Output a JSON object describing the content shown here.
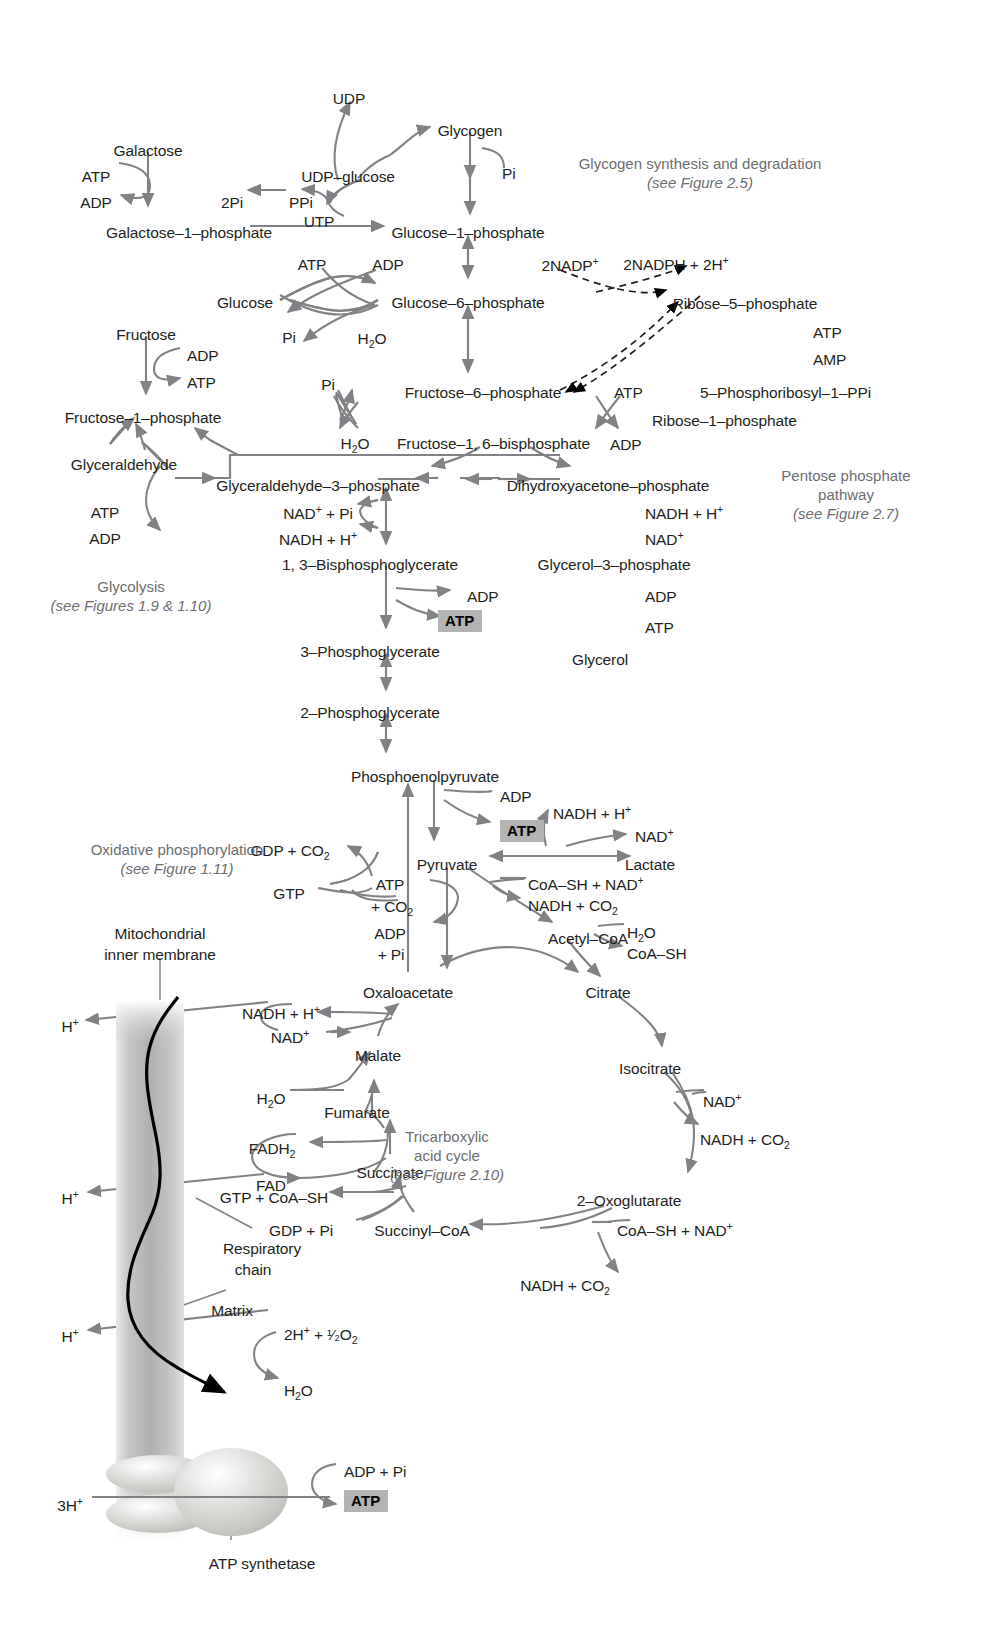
{
  "figure": {
    "type": "metabolic-pathway-diagram"
  },
  "annotations": [
    {
      "id": "glycogen-note",
      "line1": "Glycogen synthesis and degradation",
      "line2": "(see Figure 2.5)",
      "x": 700,
      "y": 155
    },
    {
      "id": "pentose-note",
      "line1": "Pentose phosphate",
      "line2": "pathway",
      "line3": "(see Figure 2.7)",
      "x": 846,
      "y": 467
    },
    {
      "id": "glycolysis-note",
      "line1": "Glycolysis",
      "line2": "(see Figures 1.9 & 1.10)",
      "x": 131,
      "y": 578
    },
    {
      "id": "oxphos-note",
      "line1": "Oxidative phosphorylation",
      "line2": "(see Figure 1.11)",
      "x": 177,
      "y": 841
    },
    {
      "id": "tca-note",
      "line1": "Tricarboxylic",
      "line2": "acid cycle",
      "line3": "(see Figure 2.10)",
      "x": 447,
      "y": 1128
    }
  ],
  "metabolites": [
    {
      "id": "udp",
      "text": "UDP",
      "x": 349,
      "y": 90,
      "align": "c"
    },
    {
      "id": "glycogen",
      "text": "Glycogen",
      "x": 470,
      "y": 122,
      "align": "c"
    },
    {
      "id": "galactose",
      "text": "Galactose",
      "x": 148,
      "y": 142,
      "align": "c"
    },
    {
      "id": "udp-glucose",
      "text": "UDP–glucose",
      "x": 348,
      "y": 168,
      "align": "c"
    },
    {
      "id": "atp-galactose",
      "text": "ATP",
      "x": 96,
      "y": 168,
      "align": "c"
    },
    {
      "id": "pi-glycogen",
      "text": "Pi",
      "x": 502,
      "y": 165,
      "align": "l"
    },
    {
      "id": "adp-galactose",
      "text": "ADP",
      "x": 96,
      "y": 194,
      "align": "c"
    },
    {
      "id": "two-pi",
      "text": "2Pi",
      "x": 232,
      "y": 194,
      "align": "c"
    },
    {
      "id": "ppi",
      "text": "PPi",
      "x": 301,
      "y": 194,
      "align": "c"
    },
    {
      "id": "utp",
      "text": "UTP",
      "x": 319,
      "y": 213,
      "align": "c"
    },
    {
      "id": "galactose-1-phosphate",
      "text": "Galactose–1–phosphate",
      "x": 189,
      "y": 224,
      "align": "c"
    },
    {
      "id": "glucose-1-phosphate",
      "text": "Glucose–1–phosphate",
      "x": 468,
      "y": 224,
      "align": "c"
    },
    {
      "id": "atp-glucose",
      "text": "ATP",
      "x": 312,
      "y": 256,
      "align": "c"
    },
    {
      "id": "adp-glucose",
      "text": "ADP",
      "x": 388,
      "y": 256,
      "align": "c"
    },
    {
      "id": "two-nadp",
      "text": "2NADP<sup>+</sup>",
      "x": 570,
      "y": 257,
      "align": "c"
    },
    {
      "id": "two-nadph",
      "text": "2NADPH + 2H<sup>+</sup>",
      "x": 676,
      "y": 256,
      "align": "c"
    },
    {
      "id": "glucose",
      "text": "Glucose",
      "x": 245,
      "y": 294,
      "align": "c"
    },
    {
      "id": "glucose-6-phosphate",
      "text": "Glucose–6–phosphate",
      "x": 468,
      "y": 294,
      "align": "c"
    },
    {
      "id": "ribose-5-phosphate",
      "text": "Ribose–5–phosphate",
      "x": 745,
      "y": 295,
      "align": "c"
    },
    {
      "id": "fructose",
      "text": "Fructose",
      "x": 146,
      "y": 326,
      "align": "c"
    },
    {
      "id": "pi-glucose",
      "text": "Pi",
      "x": 289,
      "y": 329,
      "align": "c"
    },
    {
      "id": "h2o-glucose",
      "text": "H<sub>2</sub>O",
      "x": 372,
      "y": 330,
      "align": "c"
    },
    {
      "id": "atp-ribose",
      "text": "ATP",
      "x": 813,
      "y": 324,
      "align": "l"
    },
    {
      "id": "adp-fructose",
      "text": "ADP",
      "x": 187,
      "y": 347,
      "align": "l"
    },
    {
      "id": "amp-ribose",
      "text": "AMP",
      "x": 813,
      "y": 351,
      "align": "l"
    },
    {
      "id": "pi-f6p",
      "text": "Pi",
      "x": 328,
      "y": 376,
      "align": "c"
    },
    {
      "id": "fructose-6-phosphate",
      "text": "Fructose–6–phosphate",
      "x": 483,
      "y": 384,
      "align": "c"
    },
    {
      "id": "atp-pfk",
      "text": "ATP",
      "x": 614,
      "y": 384,
      "align": "l"
    },
    {
      "id": "atp-fructose",
      "text": "ATP",
      "x": 187,
      "y": 374,
      "align": "l"
    },
    {
      "id": "prpp",
      "text": "5–Phosphoribosyl–1–PPi",
      "x": 700,
      "y": 384,
      "align": "l"
    },
    {
      "id": "fructose-1-phosphate",
      "text": "Fructose–1–phosphate",
      "x": 143,
      "y": 409,
      "align": "c"
    },
    {
      "id": "ribose-1-phosphate",
      "text": "Ribose–1–phosphate",
      "x": 652,
      "y": 412,
      "align": "l"
    },
    {
      "id": "h2o-fbp",
      "text": "H<sub>2</sub>O",
      "x": 355,
      "y": 435,
      "align": "c"
    },
    {
      "id": "fructose-1-6-bisphosphate",
      "text": "Fructose–1, 6–bisphosphate",
      "x": 397,
      "y": 435,
      "align": "l"
    },
    {
      "id": "adp-pfk",
      "text": "ADP",
      "x": 610,
      "y": 436,
      "align": "l"
    },
    {
      "id": "glyceraldehyde",
      "text": "Glyceraldehyde",
      "x": 124,
      "y": 456,
      "align": "c"
    },
    {
      "id": "glyceraldehyde-3-phosphate",
      "text": "Glyceraldehyde–3–phosphate",
      "x": 318,
      "y": 477,
      "align": "c"
    },
    {
      "id": "dihydroxyacetone-phosphate",
      "text": "Dihydroxyacetone–phosphate",
      "x": 608,
      "y": 477,
      "align": "c"
    },
    {
      "id": "atp-glyceraldehyde",
      "text": "ATP",
      "x": 105,
      "y": 504,
      "align": "c"
    },
    {
      "id": "nad-pi",
      "text": "NAD<sup>+</sup> + Pi",
      "x": 318,
      "y": 505,
      "align": "c"
    },
    {
      "id": "nadh-dhap",
      "text": "NADH + H<sup>+</sup>",
      "x": 645,
      "y": 505,
      "align": "l"
    },
    {
      "id": "adp-glyceraldehyde",
      "text": "ADP",
      "x": 105,
      "y": 530,
      "align": "c"
    },
    {
      "id": "nadh-h",
      "text": "NADH + H<sup>+</sup>",
      "x": 318,
      "y": 531,
      "align": "c"
    },
    {
      "id": "nad-dhap",
      "text": "NAD<sup>+</sup>",
      "x": 645,
      "y": 531,
      "align": "l"
    },
    {
      "id": "bisphosphoglycerate",
      "text": "1, 3–Bisphosphoglycerate",
      "x": 370,
      "y": 556,
      "align": "c"
    },
    {
      "id": "glycerol-3-phosphate",
      "text": "Glycerol–3–phosphate",
      "x": 614,
      "y": 556,
      "align": "c"
    },
    {
      "id": "adp-pgk",
      "text": "ADP",
      "x": 467,
      "y": 588,
      "align": "l"
    },
    {
      "id": "adp-glycerol",
      "text": "ADP",
      "x": 645,
      "y": 588,
      "align": "l"
    },
    {
      "id": "atp-glycerol",
      "text": "ATP",
      "x": 645,
      "y": 619,
      "align": "l"
    },
    {
      "id": "three-phosphoglycerate",
      "text": "3–Phosphoglycerate",
      "x": 370,
      "y": 643,
      "align": "c"
    },
    {
      "id": "glycerol",
      "text": "Glycerol",
      "x": 600,
      "y": 651,
      "align": "c"
    },
    {
      "id": "two-phosphoglycerate",
      "text": "2–Phosphoglycerate",
      "x": 370,
      "y": 704,
      "align": "c"
    },
    {
      "id": "phosphoenolpyruvate",
      "text": "Phosphoenolpyruvate",
      "x": 425,
      "y": 768,
      "align": "c"
    },
    {
      "id": "adp-pk",
      "text": "ADP",
      "x": 500,
      "y": 788,
      "align": "l"
    },
    {
      "id": "nadh-lactate",
      "text": "NADH + H<sup>+</sup>",
      "x": 553,
      "y": 805,
      "align": "l"
    },
    {
      "id": "gdp-co2",
      "text": "GDP + CO<sub>2</sub>",
      "x": 290,
      "y": 842,
      "align": "c"
    },
    {
      "id": "nad-lactate",
      "text": "NAD<sup>+</sup>",
      "x": 635,
      "y": 828,
      "align": "l"
    },
    {
      "id": "pyruvate",
      "text": "Pyruvate",
      "x": 447,
      "y": 856,
      "align": "c"
    },
    {
      "id": "lactate",
      "text": "Lactate",
      "x": 650,
      "y": 856,
      "align": "c"
    },
    {
      "id": "atp-pc",
      "text": "ATP",
      "x": 390,
      "y": 876,
      "align": "c"
    },
    {
      "id": "coash-nad-pdh",
      "text": "CoA–SH + NAD<sup>+</sup>",
      "x": 528,
      "y": 876,
      "align": "l"
    },
    {
      "id": "co2-pc",
      "text": "+ CO<sub>2</sub>",
      "x": 392,
      "y": 898,
      "align": "c"
    },
    {
      "id": "nadh-co2-pdh",
      "text": "NADH + CO<sub>2</sub>",
      "x": 528,
      "y": 897,
      "align": "l"
    },
    {
      "id": "gtp-pepck",
      "text": "GTP",
      "x": 289,
      "y": 885,
      "align": "c"
    },
    {
      "id": "acetyl-coa",
      "text": "Acetyl–CoA",
      "x": 588,
      "y": 930,
      "align": "c"
    },
    {
      "id": "adp-pc",
      "text": "ADP",
      "x": 390,
      "y": 925,
      "align": "c"
    },
    {
      "id": "h2o-citrate",
      "text": "H<sub>2</sub>O",
      "x": 627,
      "y": 924,
      "align": "l"
    },
    {
      "id": "pi-pc",
      "text": "+ Pi",
      "x": 391,
      "y": 946,
      "align": "c"
    },
    {
      "id": "coash-citrate",
      "text": "CoA–SH",
      "x": 627,
      "y": 945,
      "align": "l"
    },
    {
      "id": "oxaloacetate",
      "text": "Oxaloacetate",
      "x": 408,
      "y": 984,
      "align": "c"
    },
    {
      "id": "citrate",
      "text": "Citrate",
      "x": 608,
      "y": 984,
      "align": "c"
    },
    {
      "id": "nadh-malate",
      "text": "NADH + H<sup>+</sup>",
      "x": 281,
      "y": 1005,
      "align": "c"
    },
    {
      "id": "hplus-1",
      "text": "H<sup>+</sup>",
      "x": 70,
      "y": 1018,
      "align": "c"
    },
    {
      "id": "nad-malate",
      "text": "NAD<sup>+</sup>",
      "x": 290,
      "y": 1029,
      "align": "c"
    },
    {
      "id": "malate",
      "text": "Malate",
      "x": 378,
      "y": 1047,
      "align": "c"
    },
    {
      "id": "h2o-fumarase",
      "text": "H<sub>2</sub>O",
      "x": 271,
      "y": 1090,
      "align": "c"
    },
    {
      "id": "fumarate",
      "text": "Fumarate",
      "x": 357,
      "y": 1104,
      "align": "c"
    },
    {
      "id": "isocitrate",
      "text": "Isocitrate",
      "x": 650,
      "y": 1060,
      "align": "c"
    },
    {
      "id": "fadh2",
      "text": "FADH<sub>2</sub>",
      "x": 272,
      "y": 1140,
      "align": "c"
    },
    {
      "id": "nad-idh",
      "text": "NAD<sup>+</sup>",
      "x": 703,
      "y": 1093,
      "align": "l"
    },
    {
      "id": "fad",
      "text": "FAD",
      "x": 271,
      "y": 1177,
      "align": "c"
    },
    {
      "id": "succinate",
      "text": "Succinate",
      "x": 390,
      "y": 1164,
      "align": "c"
    },
    {
      "id": "nadh-co2-idh",
      "text": "NADH + CO<sub>2</sub>",
      "x": 700,
      "y": 1131,
      "align": "l"
    },
    {
      "id": "hplus-2",
      "text": "H<sup>+</sup>",
      "x": 70,
      "y": 1190,
      "align": "c"
    },
    {
      "id": "gtp-coash",
      "text": "GTP + CoA–SH",
      "x": 274,
      "y": 1189,
      "align": "c"
    },
    {
      "id": "two-oxoglutarate",
      "text": "2–Oxoglutarate",
      "x": 629,
      "y": 1192,
      "align": "c"
    },
    {
      "id": "gdp-pi",
      "text": "GDP + Pi",
      "x": 301,
      "y": 1222,
      "align": "c"
    },
    {
      "id": "succinyl-coa",
      "text": "Succinyl–CoA",
      "x": 422,
      "y": 1222,
      "align": "c"
    },
    {
      "id": "coash-nad-kgdh",
      "text": "CoA–SH + NAD<sup>+</sup>",
      "x": 617,
      "y": 1222,
      "align": "l"
    },
    {
      "id": "respiratory-chain-label",
      "text": "Respiratory",
      "x": 262,
      "y": 1240,
      "align": "c"
    },
    {
      "id": "respiratory-chain-label2",
      "text": "chain",
      "x": 253,
      "y": 1261,
      "align": "c"
    },
    {
      "id": "nadh-co2-kgdh",
      "text": "NADH + CO<sub>2</sub>",
      "x": 565,
      "y": 1277,
      "align": "c"
    },
    {
      "id": "matrix-label",
      "text": "Matrix",
      "x": 232,
      "y": 1302,
      "align": "c"
    },
    {
      "id": "hplus-3",
      "text": "H<sup>+</sup>",
      "x": 70,
      "y": 1328,
      "align": "c"
    },
    {
      "id": "two-hplus-half-o2",
      "text": "2H<sup>+</sup> + <span class=\"frac\">¹⁄₂</span>O<sub>2</sub>",
      "x": 284,
      "y": 1326,
      "align": "l"
    },
    {
      "id": "h2o-respchain",
      "text": "H<sub>2</sub>O",
      "x": 284,
      "y": 1382,
      "align": "l"
    },
    {
      "id": "adp-pi-synthase",
      "text": "ADP + Pi",
      "x": 344,
      "y": 1463,
      "align": "l"
    },
    {
      "id": "three-hplus",
      "text": "3H<sup>+</sup>",
      "x": 70,
      "y": 1497,
      "align": "c"
    },
    {
      "id": "atp-synthetase-label",
      "text": "ATP synthetase",
      "x": 262,
      "y": 1555,
      "align": "c"
    },
    {
      "id": "mito-inner-membrane",
      "text": "Mitochondrial",
      "x": 160,
      "y": 925,
      "align": "c"
    },
    {
      "id": "mito-inner-membrane2",
      "text": "inner membrane",
      "x": 160,
      "y": 946,
      "align": "c"
    }
  ],
  "atp_boxes": [
    {
      "id": "atp-box-pgk",
      "text": "ATP",
      "x": 438,
      "y": 610
    },
    {
      "id": "atp-box-pk",
      "text": "ATP",
      "x": 500,
      "y": 820
    },
    {
      "id": "atp-box-synthase",
      "text": "ATP",
      "x": 344,
      "y": 1490
    }
  ],
  "colors": {
    "arrow": "#808285",
    "text": "#231f20",
    "note": "#6d6e70",
    "atp_badge_bg": "#b3b3b3",
    "membrane": "#b0b0b0",
    "respiratory_chain": "#000000",
    "background": "#ffffff"
  },
  "membrane": {
    "label": "Mitochondrial inner membrane",
    "x": 116,
    "y": 1000,
    "width": 68,
    "height": 540
  },
  "atp_synthase": {
    "label": "ATP synthetase",
    "head_cx": 231,
    "head_cy": 1492
  }
}
